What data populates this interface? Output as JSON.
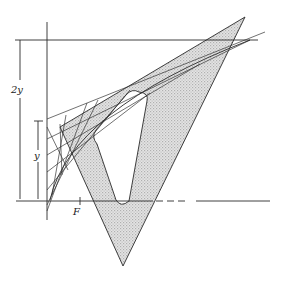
{
  "figure": {
    "labels": {
      "two_y": "2y",
      "y": "y",
      "focus": "F"
    },
    "colors": {
      "stroke": "#2a2a2a",
      "set_square_fill": "#d9d9d9",
      "background": "#ffffff"
    }
  }
}
